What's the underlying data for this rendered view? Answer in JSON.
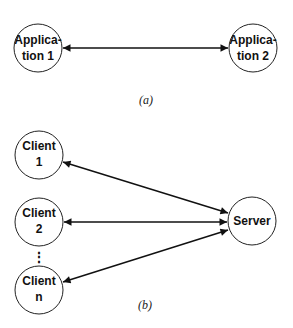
{
  "diagram_a": {
    "caption": "(a)",
    "nodes": [
      {
        "id": "app1",
        "line1": "Applica-",
        "line2": "tion 1"
      },
      {
        "id": "app2",
        "line1": "Applica-",
        "line2": "tion 2"
      }
    ],
    "edges": [
      {
        "from": "app1",
        "to": "app2",
        "type": "bidirectional"
      }
    ]
  },
  "diagram_b": {
    "caption": "(b)",
    "nodes": [
      {
        "id": "client1",
        "line1": "Client",
        "line2": "1"
      },
      {
        "id": "client2",
        "line1": "Client",
        "line2": "2"
      },
      {
        "id": "ellipsis",
        "line1": "⋮"
      },
      {
        "id": "clientn",
        "line1": "Client",
        "line2": "n"
      },
      {
        "id": "server",
        "line1": "Server"
      }
    ],
    "edges": [
      {
        "from": "client1",
        "to": "server",
        "type": "bidirectional"
      },
      {
        "from": "client2",
        "to": "server",
        "type": "bidirectional"
      },
      {
        "from": "clientn",
        "to": "server",
        "type": "bidirectional"
      }
    ]
  }
}
